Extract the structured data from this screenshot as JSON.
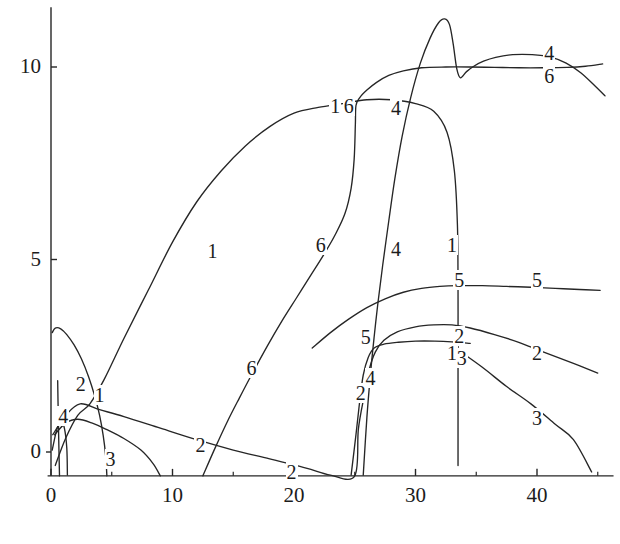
{
  "chart_data": {
    "type": "line",
    "title": "",
    "subtitle": "",
    "xlabel": "",
    "ylabel": "",
    "xlim": [
      -1.2,
      46.5
    ],
    "ylim": [
      -1.0,
      11.6
    ],
    "grid": false,
    "legend_position": "inline-curve-labels",
    "axis_style": "two-spine (left and bottom), ticks outward, no frame",
    "line_color": "#262626",
    "background_color": "#ffffff",
    "x_ticks": [
      0,
      10,
      20,
      30,
      40
    ],
    "x_tick_labels": [
      "0",
      "10",
      "20",
      "30",
      "40"
    ],
    "x_minor_ticks": [
      5,
      15,
      25,
      35,
      45
    ],
    "y_ticks": [
      0,
      5,
      10
    ],
    "y_tick_labels": [
      "0",
      "5",
      "10"
    ],
    "series": [
      {
        "name": "1",
        "label": "1",
        "label_positions": [
          [
            4.0,
            1.45
          ],
          [
            13.3,
            5.2
          ],
          [
            23.4,
            8.95
          ],
          [
            33.0,
            5.35
          ],
          [
            33.0,
            2.55
          ]
        ],
        "points": [
          [
            0.35,
            -0.35
          ],
          [
            1.2,
            0.35
          ],
          [
            2.2,
            0.95
          ],
          [
            3.2,
            1.25
          ],
          [
            4.4,
            1.9
          ],
          [
            6.0,
            2.95
          ],
          [
            8.0,
            4.2
          ],
          [
            10.0,
            5.45
          ],
          [
            12.0,
            6.5
          ],
          [
            14.0,
            7.3
          ],
          [
            16.0,
            7.95
          ],
          [
            18.0,
            8.45
          ],
          [
            20.0,
            8.8
          ],
          [
            22.0,
            8.95
          ],
          [
            24.0,
            9.05
          ],
          [
            26.0,
            9.15
          ],
          [
            28.0,
            9.15
          ],
          [
            30.0,
            9.05
          ],
          [
            31.5,
            8.85
          ],
          [
            32.6,
            8.3
          ],
          [
            33.2,
            7.3
          ],
          [
            33.45,
            5.9
          ],
          [
            33.5,
            4.3
          ],
          [
            33.5,
            2.9
          ],
          [
            33.5,
            1.2
          ],
          [
            33.5,
            -0.35
          ]
        ]
      },
      {
        "name": "2",
        "label": "2",
        "label_positions": [
          [
            2.45,
            1.75
          ],
          [
            12.3,
            0.15
          ],
          [
            19.8,
            -0.55
          ],
          [
            25.5,
            1.5
          ],
          [
            33.6,
            3.0
          ],
          [
            40.0,
            2.55
          ]
        ],
        "points": [
          [
            0.15,
            0.45
          ],
          [
            1.2,
            0.95
          ],
          [
            2.4,
            1.25
          ],
          [
            4.0,
            1.1
          ],
          [
            6.0,
            0.92
          ],
          [
            9.0,
            0.62
          ],
          [
            12.0,
            0.32
          ],
          [
            15.0,
            0.05
          ],
          [
            18.0,
            -0.18
          ],
          [
            21.0,
            -0.42
          ],
          [
            23.0,
            -0.6
          ],
          [
            25.0,
            -0.62
          ],
          [
            25.3,
            0.6
          ],
          [
            25.8,
            1.5
          ],
          [
            26.2,
            2.15
          ],
          [
            26.7,
            2.6
          ],
          [
            27.4,
            2.9
          ],
          [
            28.5,
            3.12
          ],
          [
            30.0,
            3.25
          ],
          [
            31.5,
            3.3
          ],
          [
            33.0,
            3.3
          ],
          [
            34.5,
            3.22
          ],
          [
            36.5,
            3.05
          ],
          [
            38.5,
            2.85
          ],
          [
            40.5,
            2.6
          ],
          [
            43.0,
            2.3
          ],
          [
            45.0,
            2.05
          ]
        ]
      },
      {
        "name": "3",
        "label": "3",
        "label_positions": [
          [
            4.9,
            -0.22
          ],
          [
            33.8,
            2.42
          ],
          [
            40.0,
            0.85
          ]
        ],
        "points": [
          [
            0.3,
            0.45
          ],
          [
            1.2,
            0.75
          ],
          [
            2.2,
            0.85
          ],
          [
            3.4,
            0.75
          ],
          [
            4.6,
            0.58
          ],
          [
            6.0,
            0.35
          ],
          [
            7.4,
            0.05
          ],
          [
            8.4,
            -0.3
          ],
          [
            9.0,
            -0.62
          ],
          [
            33.5,
            2.65
          ],
          [
            35.5,
            2.2
          ],
          [
            37.5,
            1.7
          ],
          [
            39.5,
            1.25
          ],
          [
            41.5,
            0.72
          ],
          [
            43.0,
            0.32
          ],
          [
            44.5,
            -0.52
          ]
        ]
      },
      {
        "name": "4",
        "label": "4",
        "label_positions": [
          [
            1.0,
            0.9
          ],
          [
            26.3,
            1.9
          ],
          [
            28.4,
            5.25
          ],
          [
            28.4,
            8.9
          ],
          [
            41.0,
            10.35
          ]
        ],
        "points": [
          [
            0.1,
            0.05
          ],
          [
            0.45,
            0.55
          ],
          [
            0.8,
            0.82
          ],
          [
            1.1,
            0.62
          ],
          [
            1.3,
            0.1
          ],
          [
            1.35,
            -0.6
          ],
          [
            25.7,
            -0.6
          ],
          [
            26.0,
            0.9
          ],
          [
            26.3,
            2.05
          ],
          [
            26.6,
            3.0
          ],
          [
            26.9,
            3.85
          ],
          [
            27.3,
            4.85
          ],
          [
            27.8,
            6.0
          ],
          [
            28.3,
            7.1
          ],
          [
            28.9,
            8.2
          ],
          [
            29.6,
            9.2
          ],
          [
            30.4,
            10.1
          ],
          [
            31.2,
            10.75
          ],
          [
            31.9,
            11.15
          ],
          [
            32.4,
            11.25
          ],
          [
            32.8,
            11.1
          ],
          [
            33.1,
            10.6
          ],
          [
            33.4,
            9.95
          ],
          [
            33.7,
            9.72
          ],
          [
            34.2,
            9.88
          ],
          [
            34.8,
            10.02
          ],
          [
            35.6,
            10.15
          ],
          [
            36.6,
            10.25
          ],
          [
            38.0,
            10.32
          ],
          [
            39.6,
            10.32
          ],
          [
            41.2,
            10.25
          ],
          [
            42.4,
            10.1
          ],
          [
            43.6,
            9.85
          ],
          [
            44.8,
            9.5
          ],
          [
            45.6,
            9.25
          ]
        ]
      },
      {
        "name": "5",
        "label": "5",
        "label_positions": [
          [
            25.9,
            2.95
          ],
          [
            33.6,
            4.45
          ],
          [
            40.0,
            4.45
          ]
        ],
        "points": [
          [
            24.7,
            -0.6
          ],
          [
            25.1,
            0.45
          ],
          [
            25.4,
            1.3
          ],
          [
            25.7,
            2.0
          ],
          [
            26.1,
            2.45
          ],
          [
            26.6,
            2.7
          ],
          [
            27.4,
            2.8
          ],
          [
            28.6,
            2.85
          ],
          [
            30.0,
            2.88
          ],
          [
            31.6,
            2.88
          ],
          [
            33.0,
            2.86
          ],
          [
            34.5,
            2.82
          ]
        ]
      },
      {
        "name": "5b",
        "label": "5",
        "label_positions": [],
        "points": [
          [
            21.5,
            2.7
          ],
          [
            23.0,
            3.1
          ],
          [
            24.5,
            3.45
          ],
          [
            26.0,
            3.75
          ],
          [
            27.5,
            3.98
          ],
          [
            29.0,
            4.15
          ],
          [
            30.5,
            4.25
          ],
          [
            32.0,
            4.3
          ],
          [
            33.5,
            4.32
          ],
          [
            35.5,
            4.32
          ],
          [
            37.5,
            4.3
          ],
          [
            39.5,
            4.28
          ],
          [
            41.5,
            4.25
          ],
          [
            43.5,
            4.22
          ],
          [
            45.2,
            4.2
          ]
        ]
      },
      {
        "name": "6",
        "label": "6",
        "label_positions": [
          [
            16.5,
            2.15
          ],
          [
            22.2,
            5.35
          ],
          [
            24.5,
            8.95
          ],
          [
            41.0,
            9.75
          ]
        ],
        "points": [
          [
            12.5,
            -0.62
          ],
          [
            13.5,
            0.1
          ],
          [
            14.5,
            0.78
          ],
          [
            15.5,
            1.4
          ],
          [
            16.5,
            2.0
          ],
          [
            17.8,
            2.75
          ],
          [
            19.0,
            3.4
          ],
          [
            20.2,
            4.0
          ],
          [
            21.4,
            4.6
          ],
          [
            22.4,
            5.1
          ],
          [
            23.4,
            5.65
          ],
          [
            24.2,
            6.2
          ],
          [
            24.7,
            6.85
          ],
          [
            24.95,
            7.6
          ],
          [
            25.05,
            8.5
          ],
          [
            25.1,
            9.0
          ],
          [
            25.4,
            9.2
          ],
          [
            26.0,
            9.4
          ],
          [
            26.8,
            9.6
          ],
          [
            27.8,
            9.78
          ],
          [
            29.0,
            9.9
          ],
          [
            30.5,
            9.98
          ],
          [
            32.5,
            10.0
          ],
          [
            34.5,
            10.0
          ],
          [
            36.5,
            9.99
          ],
          [
            38.5,
            9.98
          ],
          [
            40.5,
            9.98
          ],
          [
            42.5,
            9.99
          ],
          [
            44.0,
            10.02
          ],
          [
            45.4,
            10.08
          ]
        ]
      },
      {
        "name": "dome",
        "label": "",
        "label_positions": [],
        "points": [
          [
            0.1,
            3.1
          ],
          [
            0.35,
            3.22
          ],
          [
            0.8,
            3.2
          ],
          [
            1.3,
            3.05
          ],
          [
            1.9,
            2.78
          ],
          [
            2.5,
            2.42
          ],
          [
            3.1,
            1.95
          ],
          [
            3.6,
            1.45
          ],
          [
            4.0,
            0.95
          ],
          [
            4.3,
            0.42
          ],
          [
            4.5,
            -0.1
          ],
          [
            4.6,
            -0.62
          ]
        ]
      },
      {
        "name": "spike",
        "label": "",
        "label_positions": [],
        "points": [
          [
            0.55,
            1.85
          ],
          [
            0.6,
            0.9
          ],
          [
            0.65,
            0.1
          ],
          [
            0.7,
            -0.62
          ]
        ]
      }
    ],
    "annotations": [
      {
        "text": "1",
        "x": 4.0,
        "y": 1.45
      },
      {
        "text": "1",
        "x": 13.3,
        "y": 5.2
      },
      {
        "text": "1",
        "x": 23.4,
        "y": 8.95
      },
      {
        "text": "1",
        "x": 33.0,
        "y": 5.35
      },
      {
        "text": "1",
        "x": 33.0,
        "y": 2.55
      },
      {
        "text": "2",
        "x": 2.45,
        "y": 1.75
      },
      {
        "text": "2",
        "x": 12.3,
        "y": 0.15
      },
      {
        "text": "2",
        "x": 19.8,
        "y": -0.55
      },
      {
        "text": "2",
        "x": 25.5,
        "y": 1.5
      },
      {
        "text": "2",
        "x": 33.6,
        "y": 3.0
      },
      {
        "text": "2",
        "x": 40.0,
        "y": 2.55
      },
      {
        "text": "3",
        "x": 4.9,
        "y": -0.22
      },
      {
        "text": "3",
        "x": 33.8,
        "y": 2.42
      },
      {
        "text": "3",
        "x": 40.0,
        "y": 0.85
      },
      {
        "text": "4",
        "x": 1.0,
        "y": 0.9
      },
      {
        "text": "4",
        "x": 26.3,
        "y": 1.9
      },
      {
        "text": "4",
        "x": 28.4,
        "y": 5.25
      },
      {
        "text": "4",
        "x": 28.4,
        "y": 8.9
      },
      {
        "text": "4",
        "x": 41.0,
        "y": 10.35
      },
      {
        "text": "5",
        "x": 25.9,
        "y": 2.95
      },
      {
        "text": "5",
        "x": 33.6,
        "y": 4.45
      },
      {
        "text": "5",
        "x": 40.0,
        "y": 4.45
      },
      {
        "text": "6",
        "x": 16.5,
        "y": 2.15
      },
      {
        "text": "6",
        "x": 22.2,
        "y": 5.35
      },
      {
        "text": "6",
        "x": 24.5,
        "y": 8.95
      },
      {
        "text": "6",
        "x": 41.0,
        "y": 9.75
      }
    ]
  }
}
